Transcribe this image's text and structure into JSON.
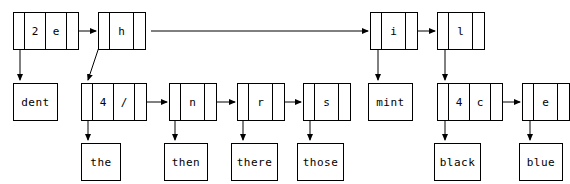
{
  "figure": {
    "type": "trie-linked-list-diagram",
    "title": "",
    "stroke_color": "#000000",
    "background_color": "#ffffff",
    "nodes": [
      {
        "id": "n-2e",
        "cells": [
          "",
          "2",
          "e",
          ""
        ],
        "x": 13,
        "y": 12,
        "row": "top"
      },
      {
        "id": "n-h",
        "cells": [
          "",
          "h",
          ""
        ],
        "x": 98,
        "y": 12,
        "row": "top"
      },
      {
        "id": "n-i",
        "cells": [
          "",
          "i",
          ""
        ],
        "x": 370,
        "y": 12,
        "row": "top"
      },
      {
        "id": "n-l",
        "cells": [
          "",
          "l",
          ""
        ],
        "x": 437,
        "y": 12,
        "row": "top"
      },
      {
        "id": "n-4slash",
        "cells": [
          "",
          "4",
          "/",
          ""
        ],
        "x": 81,
        "y": 83,
        "row": "middle"
      },
      {
        "id": "n-n",
        "cells": [
          "",
          "n",
          ""
        ],
        "x": 169,
        "y": 83,
        "row": "middle"
      },
      {
        "id": "n-r",
        "cells": [
          "",
          "r",
          ""
        ],
        "x": 237,
        "y": 83,
        "row": "middle"
      },
      {
        "id": "n-s",
        "cells": [
          "",
          "s",
          ""
        ],
        "x": 303,
        "y": 83,
        "row": "middle"
      },
      {
        "id": "n-4c",
        "cells": [
          "",
          "4",
          "c",
          ""
        ],
        "x": 437,
        "y": 83,
        "row": "middle"
      },
      {
        "id": "n-e",
        "cells": [
          "",
          "e",
          ""
        ],
        "x": 522,
        "y": 83,
        "row": "middle"
      }
    ],
    "word_boxes": [
      {
        "id": "w-dent",
        "label": "dent",
        "x": 13,
        "y": 83,
        "width": 45,
        "row": "middle"
      },
      {
        "id": "w-mint",
        "label": "mint",
        "x": 368,
        "y": 83,
        "width": 45,
        "row": "middle"
      },
      {
        "id": "w-the",
        "label": "the",
        "x": 81,
        "y": 143,
        "width": 40,
        "row": "bottom"
      },
      {
        "id": "w-then",
        "label": "then",
        "x": 164,
        "y": 143,
        "width": 44,
        "row": "bottom"
      },
      {
        "id": "w-there",
        "label": "there",
        "x": 231,
        "y": 143,
        "width": 47,
        "row": "bottom"
      },
      {
        "id": "w-those",
        "label": "those",
        "x": 297,
        "y": 143,
        "width": 47,
        "row": "bottom"
      },
      {
        "id": "w-black",
        "label": "black",
        "x": 434,
        "y": 143,
        "width": 47,
        "row": "bottom"
      },
      {
        "id": "w-blue",
        "label": "blue",
        "x": 519,
        "y": 143,
        "width": 44,
        "row": "bottom"
      }
    ],
    "edges": [
      {
        "id": "e-2e-to-h",
        "from": "n-2e",
        "to": "n-h",
        "kind": "horizontal-arrow"
      },
      {
        "id": "e-2e-to-dent",
        "from": "n-2e",
        "to": "w-dent",
        "kind": "vertical-arrow"
      },
      {
        "id": "e-h-to-i",
        "from": "n-h",
        "to": "n-i",
        "kind": "long-horizontal-arrow"
      },
      {
        "id": "e-h-to-4slash",
        "from": "n-h",
        "to": "n-4slash",
        "kind": "diagonal-arrow"
      },
      {
        "id": "e-4slash-to-n",
        "from": "n-4slash",
        "to": "n-n",
        "kind": "horizontal-arrow"
      },
      {
        "id": "e-4slash-to-the",
        "from": "n-4slash",
        "to": "w-the",
        "kind": "vertical-arrow"
      },
      {
        "id": "e-n-to-r",
        "from": "n-n",
        "to": "n-r",
        "kind": "horizontal-arrow"
      },
      {
        "id": "e-n-to-then",
        "from": "n-n",
        "to": "w-then",
        "kind": "vertical-arrow"
      },
      {
        "id": "e-r-to-s",
        "from": "n-r",
        "to": "n-s",
        "kind": "horizontal-arrow"
      },
      {
        "id": "e-r-to-there",
        "from": "n-r",
        "to": "w-there",
        "kind": "vertical-arrow"
      },
      {
        "id": "e-s-to-those",
        "from": "n-s",
        "to": "w-those",
        "kind": "vertical-arrow"
      },
      {
        "id": "e-i-to-l",
        "from": "n-i",
        "to": "n-l",
        "kind": "horizontal-arrow"
      },
      {
        "id": "e-i-to-mint",
        "from": "n-i",
        "to": "w-mint",
        "kind": "vertical-arrow"
      },
      {
        "id": "e-l-to-4c",
        "from": "n-l",
        "to": "n-4c",
        "kind": "vertical-arrow"
      },
      {
        "id": "e-4c-to-e",
        "from": "n-4c",
        "to": "n-e",
        "kind": "horizontal-arrow"
      },
      {
        "id": "e-4c-to-black",
        "from": "n-4c",
        "to": "w-black",
        "kind": "vertical-arrow"
      },
      {
        "id": "e-e-to-blue",
        "from": "n-e",
        "to": "w-blue",
        "kind": "vertical-arrow"
      }
    ]
  }
}
